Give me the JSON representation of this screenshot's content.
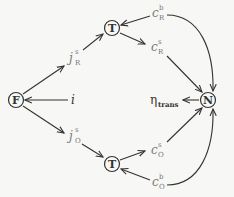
{
  "diagram": {
    "nodes": {
      "F": {
        "label": "F"
      },
      "T_top": {
        "label": "T"
      },
      "T_bottom": {
        "label": "T"
      },
      "N": {
        "label": "N"
      }
    },
    "labels": {
      "i": {
        "base": "i"
      },
      "j_R_s": {
        "base": "j",
        "sup": "s",
        "sub": "R"
      },
      "j_O_s": {
        "base": "j",
        "sup": "s",
        "sub": "O"
      },
      "c_R_b": {
        "base": "c",
        "sup": "b",
        "sub": "R"
      },
      "c_R_s": {
        "base": "c",
        "sup": "s",
        "sub": "R"
      },
      "c_O_s": {
        "base": "c",
        "sup": "s",
        "sub": "O"
      },
      "c_O_b": {
        "base": "c",
        "sup": "b",
        "sub": "O"
      },
      "eta_trans": {
        "base": "η",
        "sub": "trans"
      }
    },
    "edges": [
      {
        "from": "F",
        "to": "j_R_s"
      },
      {
        "from": "j_R_s",
        "to": "T_top"
      },
      {
        "from": "c_R_b",
        "to": "T_top"
      },
      {
        "from": "T_top",
        "to": "c_R_s"
      },
      {
        "from": "c_R_s",
        "to": "N"
      },
      {
        "from": "c_R_b",
        "to": "N",
        "curved": true
      },
      {
        "from": "i",
        "to": "F"
      },
      {
        "from": "N",
        "to": "eta_trans"
      },
      {
        "from": "F",
        "to": "j_O_s"
      },
      {
        "from": "j_O_s",
        "to": "T_bottom"
      },
      {
        "from": "T_bottom",
        "to": "c_O_s"
      },
      {
        "from": "c_O_s",
        "to": "N"
      },
      {
        "from": "c_O_b",
        "to": "T_bottom"
      },
      {
        "from": "c_O_b",
        "to": "N",
        "curved": true
      }
    ],
    "colors": {
      "stroke": "#333333",
      "label": "#777777",
      "background": "#f7f7f5"
    }
  }
}
